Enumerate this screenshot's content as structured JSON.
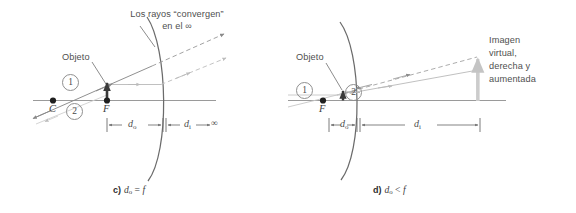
{
  "figure": {
    "background_color": "#ffffff",
    "axis_color": "#9a9a9a",
    "mirror_color": "#6b6b6b",
    "ray_solid_color": "#8a8a8a",
    "ray_dashed_color": "#b9b9b9",
    "object_color": "#3a3a3a",
    "image_color": "#c9c9c9",
    "text_color": "#4f4f4f",
    "dimension_color": "#707070"
  },
  "panel_c": {
    "caption_label": "c)",
    "caption_expr_do": "d",
    "caption_expr_do_sub": "o",
    "caption_expr_rel": " = ",
    "caption_expr_f": "f",
    "caption_full": "c) do = f",
    "converge_note_line1": "Los rayos “convergen”",
    "converge_note_line2": "en el ∞",
    "object_label": "Objeto",
    "ray1_label": "1",
    "ray2_label": "2",
    "point_center_label": "C",
    "point_focus_label": "F",
    "dim_do_label": "d",
    "dim_do_sub": "o",
    "dim_di_label": "d",
    "dim_di_sub": "i",
    "dim_di_suffix": "∞"
  },
  "panel_d": {
    "caption_label": "d)",
    "caption_expr_do": "d",
    "caption_expr_do_sub": "o",
    "caption_expr_rel": " < ",
    "caption_expr_f": "f",
    "caption_full": "d) do < f",
    "object_label": "Objeto",
    "ray1_label": "1",
    "ray2_label": "2",
    "point_focus_label": "F",
    "image_note_line1": "Imagen",
    "image_note_line2": "virtual,",
    "image_note_line3": "derecha y",
    "image_note_line4": "aumentada",
    "dim_do_label": "d",
    "dim_do_sub": "o",
    "dim_di_label": "d",
    "dim_di_sub": "i"
  }
}
